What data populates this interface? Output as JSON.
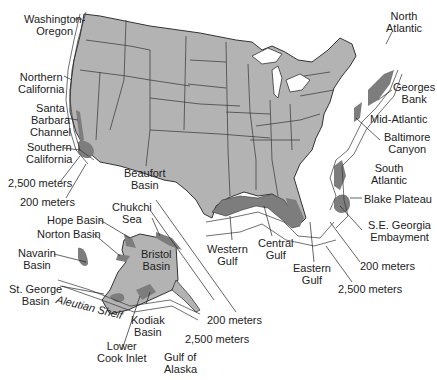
{
  "map": {
    "type": "thematic-map",
    "subject": "U.S. offshore planning areas / sedimentary basins",
    "colors": {
      "land": "#b3b3b3",
      "basin_shading": "#7d7d7d",
      "borders": "#333333",
      "water": "#ffffff"
    }
  },
  "labels": {
    "washington_oregon": [
      "Washington-",
      "Oregon"
    ],
    "northern_california": [
      "Northern",
      "California"
    ],
    "santa_barbara": [
      "Santa",
      "Barbara",
      "Channel"
    ],
    "southern_california": [
      "Southern",
      "California"
    ],
    "west_2500": "2,500 meters",
    "west_200": "200 meters",
    "north_atlantic": [
      "North",
      "Atlantic"
    ],
    "georges_bank": [
      "Georges",
      "Bank"
    ],
    "mid_atlantic": "Mid-Atlantic",
    "baltimore_canyon": [
      "Baltimore",
      "Canyon"
    ],
    "south_atlantic": [
      "South",
      "Atlantic"
    ],
    "blake_plateau": "Blake Plateau",
    "se_georgia": [
      "S.E. Georgia",
      "Embayment"
    ],
    "east_200": "200 meters",
    "east_2500": "2,500 meters",
    "western_gulf": [
      "Western",
      "Gulf"
    ],
    "central_gulf": [
      "Central",
      "Gulf"
    ],
    "eastern_gulf": [
      "Eastern",
      "Gulf"
    ],
    "beaufort_basin": [
      "Beaufort",
      "Basin"
    ],
    "chukchi_sea": [
      "Chukchi",
      "Sea"
    ],
    "hope_basin": "Hope Basin",
    "norton_basin": "Norton Basin",
    "navarin_basin": [
      "Navarin",
      "Basin"
    ],
    "bristol_basin": [
      "Bristol",
      "Basin"
    ],
    "st_george_basin": [
      "St. George",
      "Basin"
    ],
    "aleutian_shelf": "Aleutian Shelf",
    "kodiak_basin": [
      "Kodiak",
      "Basin"
    ],
    "lower_cook_inlet": [
      "Lower",
      "Cook Inlet"
    ],
    "gulf_of_alaska": [
      "Gulf of",
      "Alaska"
    ],
    "alaska_200": "200 meters",
    "alaska_2500": "2,500 meters"
  }
}
